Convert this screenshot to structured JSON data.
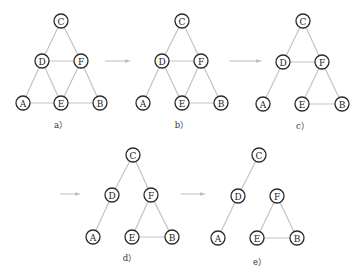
{
  "diagram": {
    "type": "graph-sequence",
    "node_radius": 7,
    "colors": {
      "edge": "#c4c4c4",
      "node_stroke": "#2a2a2a",
      "text": "#1e1e1e",
      "arrow": "#bdbdbd"
    },
    "panels": [
      {
        "caption": "a）",
        "caption_pos": [
          61,
          125
        ],
        "nodes": [
          {
            "id": "C",
            "x": 61,
            "y": 21
          },
          {
            "id": "D",
            "x": 42,
            "y": 61
          },
          {
            "id": "F",
            "x": 81,
            "y": 61
          },
          {
            "id": "A",
            "x": 23,
            "y": 103
          },
          {
            "id": "E",
            "x": 61,
            "y": 103
          },
          {
            "id": "B",
            "x": 100,
            "y": 103
          }
        ],
        "edges": [
          [
            "C",
            "D"
          ],
          [
            "C",
            "F"
          ],
          [
            "D",
            "F"
          ],
          [
            "D",
            "A"
          ],
          [
            "D",
            "E"
          ],
          [
            "F",
            "E"
          ],
          [
            "F",
            "B"
          ],
          [
            "A",
            "E"
          ],
          [
            "E",
            "B"
          ]
        ]
      },
      {
        "caption": "b）",
        "caption_pos": [
          182,
          125
        ],
        "nodes": [
          {
            "id": "C",
            "x": 182,
            "y": 21
          },
          {
            "id": "D",
            "x": 162,
            "y": 61
          },
          {
            "id": "F",
            "x": 201,
            "y": 61
          },
          {
            "id": "A",
            "x": 143,
            "y": 103
          },
          {
            "id": "E",
            "x": 182,
            "y": 103
          },
          {
            "id": "B",
            "x": 221,
            "y": 103
          }
        ],
        "edges": [
          [
            "C",
            "D"
          ],
          [
            "C",
            "F"
          ],
          [
            "D",
            "F"
          ],
          [
            "D",
            "A"
          ],
          [
            "D",
            "E"
          ],
          [
            "F",
            "E"
          ],
          [
            "F",
            "B"
          ],
          [
            "E",
            "B"
          ]
        ]
      },
      {
        "caption": "c）",
        "caption_pos": [
          303,
          126
        ],
        "nodes": [
          {
            "id": "C",
            "x": 303,
            "y": 21
          },
          {
            "id": "D",
            "x": 283,
            "y": 62
          },
          {
            "id": "F",
            "x": 322,
            "y": 62
          },
          {
            "id": "A",
            "x": 263,
            "y": 104
          },
          {
            "id": "E",
            "x": 302,
            "y": 104
          },
          {
            "id": "B",
            "x": 342,
            "y": 104
          }
        ],
        "edges": [
          [
            "C",
            "D"
          ],
          [
            "C",
            "F"
          ],
          [
            "D",
            "F"
          ],
          [
            "D",
            "A"
          ],
          [
            "F",
            "E"
          ],
          [
            "F",
            "B"
          ],
          [
            "E",
            "B"
          ]
        ]
      },
      {
        "caption": "d）",
        "caption_pos": [
          130,
          258
        ],
        "nodes": [
          {
            "id": "C",
            "x": 133,
            "y": 155
          },
          {
            "id": "D",
            "x": 112,
            "y": 195
          },
          {
            "id": "F",
            "x": 151,
            "y": 195
          },
          {
            "id": "A",
            "x": 93,
            "y": 237
          },
          {
            "id": "E",
            "x": 132,
            "y": 237
          },
          {
            "id": "B",
            "x": 172,
            "y": 237
          }
        ],
        "edges": [
          [
            "C",
            "D"
          ],
          [
            "C",
            "F"
          ],
          [
            "D",
            "A"
          ],
          [
            "F",
            "E"
          ],
          [
            "F",
            "B"
          ],
          [
            "E",
            "B"
          ]
        ]
      },
      {
        "caption": "e）",
        "caption_pos": [
          260,
          262
        ],
        "nodes": [
          {
            "id": "C",
            "x": 259,
            "y": 155
          },
          {
            "id": "D",
            "x": 238,
            "y": 196
          },
          {
            "id": "F",
            "x": 277,
            "y": 196
          },
          {
            "id": "A",
            "x": 218,
            "y": 238
          },
          {
            "id": "E",
            "x": 257,
            "y": 238
          },
          {
            "id": "B",
            "x": 297,
            "y": 238
          }
        ],
        "edges": [
          [
            "C",
            "D"
          ],
          [
            "D",
            "A"
          ],
          [
            "F",
            "E"
          ],
          [
            "F",
            "B"
          ],
          [
            "E",
            "B"
          ]
        ]
      }
    ],
    "arrows": [
      {
        "x1": 105,
        "y1": 61,
        "x2": 131,
        "y2": 61
      },
      {
        "x1": 229,
        "y1": 61,
        "x2": 262,
        "y2": 61
      },
      {
        "x1": 60,
        "y1": 194,
        "x2": 81,
        "y2": 194
      },
      {
        "x1": 181,
        "y1": 194,
        "x2": 206,
        "y2": 194
      }
    ]
  }
}
